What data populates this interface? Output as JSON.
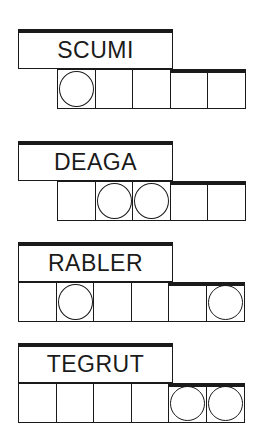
{
  "game": "Jumble word puzzle",
  "colors": {
    "ink": "#1a1a1a",
    "background": "#ffffff"
  },
  "clues": [
    {
      "scrambled": "SCUMI",
      "cells": 5,
      "cells_left": 57,
      "label_top": 29,
      "cells_top": 70,
      "circled": [
        1
      ]
    },
    {
      "scrambled": "DEAGA",
      "cells": 5,
      "cells_left": 57,
      "label_top": 141,
      "cells_top": 182,
      "circled": [
        2,
        3
      ]
    },
    {
      "scrambled": "RABLER",
      "cells": 6,
      "cells_left": 18,
      "label_top": 242,
      "cells_top": 283,
      "circled": [
        2,
        6
      ]
    },
    {
      "scrambled": "TEGRUT",
      "cells": 6,
      "cells_left": 18,
      "label_top": 343,
      "cells_top": 384,
      "circled": [
        5,
        6
      ]
    }
  ]
}
